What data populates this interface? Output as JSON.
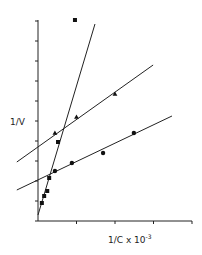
{
  "chart_data": {
    "type": "scatter",
    "title": "",
    "xlabel": "1/C x 10^-3",
    "ylabel": "1/V",
    "xlim": [
      0,
      4
    ],
    "ylim": [
      0,
      10
    ],
    "x_ticks": [
      0,
      1,
      2,
      3,
      4
    ],
    "y_ticks": [
      0,
      1,
      2,
      3,
      4,
      5,
      6,
      7,
      8,
      9,
      10
    ],
    "grid": false,
    "legend": null,
    "series": [
      {
        "name": "squares",
        "marker": "square",
        "points": [
          [
            0.1,
            0.9
          ],
          [
            0.16,
            1.25
          ],
          [
            0.24,
            1.5
          ],
          [
            0.29,
            2.15
          ],
          [
            0.52,
            3.95
          ],
          [
            0.96,
            10.05
          ]
        ],
        "fit_line": [
          [
            0.0,
            0.3
          ],
          [
            1.48,
            9.85
          ]
        ]
      },
      {
        "name": "triangles",
        "marker": "triangle",
        "points": [
          [
            0.44,
            4.4
          ],
          [
            1.0,
            5.2
          ],
          [
            2.0,
            6.35
          ]
        ],
        "fit_line": [
          [
            -0.55,
            2.95
          ],
          [
            2.99,
            7.8
          ]
        ]
      },
      {
        "name": "circles",
        "marker": "circle",
        "points": [
          [
            0.44,
            2.5
          ],
          [
            0.88,
            2.9
          ],
          [
            1.69,
            3.4
          ],
          [
            2.49,
            4.4
          ]
        ],
        "fit_line": [
          [
            -0.55,
            1.55
          ],
          [
            3.48,
            5.25
          ]
        ]
      }
    ]
  },
  "labels": {
    "ylabel": "1/V",
    "xlabel": "1/C x 10",
    "xlabel_exp": "-3"
  }
}
